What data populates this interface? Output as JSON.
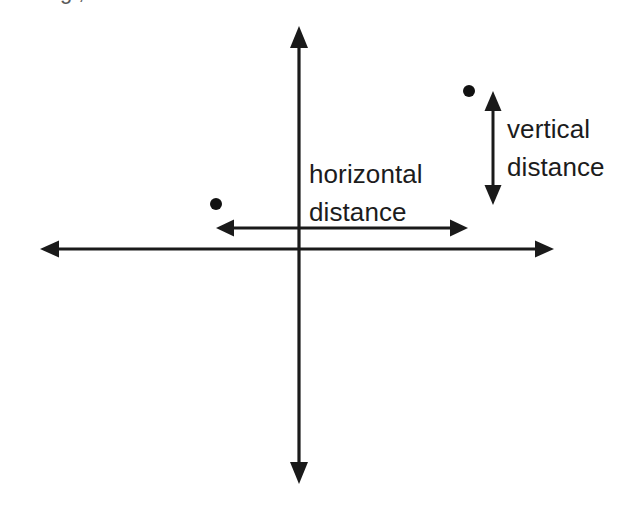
{
  "figure": {
    "background_color": "#ffffff",
    "ink_color": "#1a1a1a",
    "clipped_top_caption": "g ,",
    "labels": {
      "horizontal_line1": "horizontal",
      "horizontal_line2": "distance",
      "vertical_line1": "vertical",
      "vertical_line2": "distance"
    }
  },
  "chart_data": {
    "type": "scatter",
    "title": "",
    "xlabel": "",
    "ylabel": "",
    "grid": false,
    "legend": null,
    "axes": {
      "style": "double-headed-arrow-cross",
      "origin_px": [
        299,
        249
      ],
      "x_axis": {
        "from_px": [
          40,
          249
        ],
        "to_px": [
          554,
          249
        ],
        "arrowheads": "both",
        "tick_labels": []
      },
      "y_axis": {
        "from_px": [
          299,
          26
        ],
        "to_px": [
          299,
          484
        ],
        "arrowheads": "both",
        "tick_labels": []
      }
    },
    "points": [
      {
        "name": "lower-left-point",
        "px": [
          216,
          204
        ],
        "quadrant": "II",
        "radius_px": 6
      },
      {
        "name": "upper-right-point",
        "px": [
          469,
          91
        ],
        "quadrant": "I",
        "radius_px": 6
      }
    ],
    "annotations": [
      {
        "name": "horizontal-distance",
        "label": "horizontal distance",
        "orientation": "horizontal",
        "arrow": "double",
        "from_px": [
          216,
          228
        ],
        "to_px": [
          468,
          228
        ],
        "length_px": 252
      },
      {
        "name": "vertical-distance",
        "label": "vertical distance",
        "orientation": "vertical",
        "arrow": "double",
        "from_px": [
          493,
          91
        ],
        "to_px": [
          493,
          205
        ],
        "length_px": 114
      }
    ]
  }
}
